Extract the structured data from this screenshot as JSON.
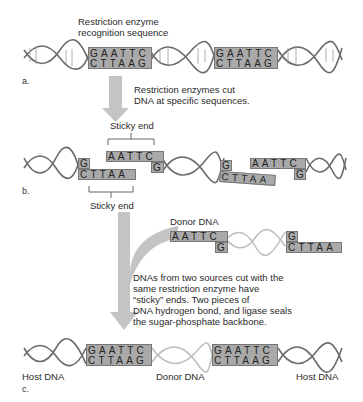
{
  "panel_a": {
    "label": "a.",
    "caption": [
      "Restriction enzyme",
      "recognition sequence"
    ],
    "site_top": "GAATTC",
    "site_bottom": "CTTAAG"
  },
  "arrow1_text": [
    "Restriction enzymes cut",
    "DNA at specific sequences."
  ],
  "panel_b": {
    "label": "b.",
    "sticky_end_top_label": "Sticky end",
    "sticky_end_bottom_label": "Sticky end",
    "frag_left_top": "G",
    "frag_left_bottom": "CTTAA",
    "frag_right_top": "AATTC",
    "frag_right_bottom": "G",
    "frag2_left_top": "G",
    "frag2_left_bottom": "CTTAA",
    "frag2_right_top": "AATTC",
    "frag2_right_bottom": "G"
  },
  "donor": {
    "label": "Donor DNA",
    "left_top": "AATTC",
    "left_bottom": "G",
    "right_top": "G",
    "right_bottom": "CTTAA"
  },
  "arrow2_text": [
    "DNAs from two sources cut with the",
    "same restriction enzyme have",
    "“sticky” ends. Two pieces of",
    "DNA hydrogen bond, and ligase seals",
    "the sugar-phosphate backbone."
  ],
  "panel_c": {
    "label": "c.",
    "host_left": "Host DNA",
    "donor_middle": "Donor DNA",
    "host_right": "Host DNA",
    "site_top": "GAATTC",
    "site_bottom": "CTTAAG"
  },
  "colors": {
    "box_fill": "#a9a9a9",
    "arrow_fill": "#c4c4c4",
    "helix_dark": "#6b6b6b",
    "helix_light": "#bdbdbd"
  }
}
